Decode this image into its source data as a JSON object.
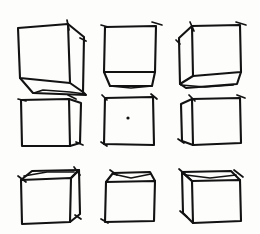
{
  "sheet": {
    "title": "Cube Perspective Study",
    "medium": "hand-drawn ink sketch",
    "background_color": "#fdfdfc",
    "ink_color": "#121212",
    "grid": {
      "rows": 3,
      "columns": 3,
      "cell_count": 9
    }
  },
  "chart_data": {
    "type": "diagram",
    "subtitle": "Nine views of a cube arranged in a 3x3 grid",
    "grid": {
      "rows": 3,
      "cols": 3
    },
    "cells": [
      {
        "index": 1,
        "row": 1,
        "col": 1,
        "name": "cube-top-left",
        "viewpoint": "above-left",
        "visible_faces": [
          "front",
          "right",
          "bottom"
        ],
        "has_center_dot": false,
        "front_face": {
          "x": 18,
          "y": 24,
          "w": 52,
          "h": 48
        },
        "depth": {
          "dx": 14,
          "dy": 10
        }
      },
      {
        "index": 2,
        "row": 1,
        "col": 2,
        "name": "cube-top-center",
        "viewpoint": "above-center",
        "visible_faces": [
          "front",
          "bottom"
        ],
        "has_center_dot": false,
        "front_face": {
          "x": 104,
          "y": 24,
          "w": 50,
          "h": 46
        },
        "depth": {
          "dx": 0,
          "dy": 11
        }
      },
      {
        "index": 3,
        "row": 1,
        "col": 3,
        "name": "cube-top-right",
        "viewpoint": "above-right",
        "visible_faces": [
          "front",
          "left",
          "bottom"
        ],
        "has_center_dot": false,
        "front_face": {
          "x": 192,
          "y": 24,
          "w": 50,
          "h": 46
        },
        "depth": {
          "dx": -14,
          "dy": 10
        }
      },
      {
        "index": 4,
        "row": 2,
        "col": 1,
        "name": "cube-middle-left",
        "viewpoint": "level-left",
        "visible_faces": [
          "front",
          "right"
        ],
        "has_center_dot": false,
        "front_face": {
          "x": 20,
          "y": 100,
          "w": 50,
          "h": 46
        },
        "depth": {
          "dx": 12,
          "dy": 0
        }
      },
      {
        "index": 5,
        "row": 2,
        "col": 2,
        "name": "cube-middle-center",
        "viewpoint": "head-on",
        "visible_faces": [
          "front"
        ],
        "has_center_dot": true,
        "center_dot": {
          "x": 128,
          "y": 118,
          "r": 1.6
        },
        "front_face": {
          "x": 104,
          "y": 96,
          "w": 50,
          "h": 48
        },
        "depth": {
          "dx": 0,
          "dy": 0
        }
      },
      {
        "index": 6,
        "row": 2,
        "col": 3,
        "name": "cube-middle-right",
        "viewpoint": "level-right",
        "visible_faces": [
          "front",
          "left"
        ],
        "has_center_dot": false,
        "front_face": {
          "x": 192,
          "y": 98,
          "w": 50,
          "h": 46
        },
        "depth": {
          "dx": -12,
          "dy": 0
        }
      },
      {
        "index": 7,
        "row": 3,
        "col": 1,
        "name": "cube-bottom-left",
        "viewpoint": "below-left",
        "visible_faces": [
          "front",
          "top",
          "right"
        ],
        "has_center_dot": false,
        "front_face": {
          "x": 20,
          "y": 178,
          "w": 50,
          "h": 46
        },
        "depth": {
          "dx": 12,
          "dy": -10
        }
      },
      {
        "index": 8,
        "row": 3,
        "col": 2,
        "name": "cube-bottom-center",
        "viewpoint": "below-center",
        "visible_faces": [
          "front",
          "top"
        ],
        "has_center_dot": false,
        "front_face": {
          "x": 104,
          "y": 180,
          "w": 50,
          "h": 44
        },
        "depth": {
          "dx": 0,
          "dy": -10
        }
      },
      {
        "index": 9,
        "row": 3,
        "col": 3,
        "name": "cube-bottom-right",
        "viewpoint": "below-right",
        "visible_faces": [
          "front",
          "top",
          "left"
        ],
        "has_center_dot": false,
        "front_face": {
          "x": 192,
          "y": 178,
          "w": 50,
          "h": 46
        },
        "depth": {
          "dx": -13,
          "dy": -10
        }
      }
    ]
  }
}
